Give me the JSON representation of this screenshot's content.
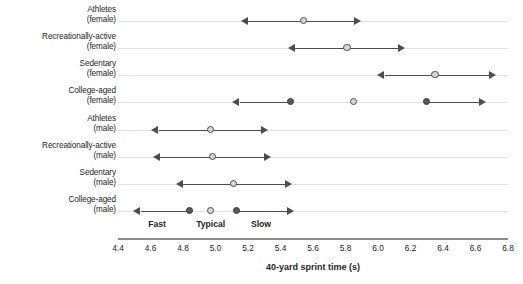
{
  "chart_data": {
    "type": "scatter",
    "title": "",
    "xlabel": "40-yard sprint time (s)",
    "ylabel": "",
    "xlim": [
      4.4,
      6.8
    ],
    "xticks": [
      "4.4",
      "4.6",
      "4.8",
      "5.0",
      "5.2",
      "5.4",
      "5.6",
      "5.8",
      "6.0",
      "6.2",
      "6.4",
      "6.6",
      "6.8"
    ],
    "xtick_values": [
      4.4,
      4.6,
      4.8,
      5.0,
      5.2,
      5.4,
      5.6,
      5.8,
      6.0,
      6.2,
      6.4,
      6.6,
      6.8
    ],
    "grid": false,
    "legend": "none",
    "orientation": "horizontal",
    "categories": [
      {
        "line1": "Athletes",
        "line2": "(female)"
      },
      {
        "line1": "Recreationally-active",
        "line2": "(female)"
      },
      {
        "line1": "Sedentary",
        "line2": "(female)"
      },
      {
        "line1": "College-aged",
        "line2": "(female)"
      },
      {
        "line1": "Athletes",
        "line2": "(male)"
      },
      {
        "line1": "Recreationally-active",
        "line2": "(male)"
      },
      {
        "line1": "Sedentary",
        "line2": "(male)"
      },
      {
        "line1": "College-aged",
        "line2": "(male)"
      }
    ],
    "rows": [
      {
        "category": "Athletes (female)",
        "markers": [
          {
            "value": 5.54,
            "style": "light",
            "arrow_left": true,
            "arrow_right": true,
            "range": [
              5.28,
              5.77
            ]
          }
        ]
      },
      {
        "category": "Recreationally-active (female)",
        "markers": [
          {
            "value": 5.81,
            "style": "light",
            "arrow_left": true,
            "arrow_right": true,
            "range": [
              5.57,
              6.04
            ]
          }
        ]
      },
      {
        "category": "Sedentary (female)",
        "markers": [
          {
            "value": 6.35,
            "style": "light",
            "arrow_left": true,
            "arrow_right": true,
            "range": [
              6.12,
              6.6
            ]
          }
        ]
      },
      {
        "category": "College-aged (female)",
        "markers": [
          {
            "value": 5.46,
            "style": "dark",
            "arrow_left": true,
            "arrow_right": false,
            "range": [
              5.23,
              5.46
            ]
          },
          {
            "value": 5.85,
            "style": "light",
            "arrow_left": false,
            "arrow_right": false,
            "range": [
              5.85,
              5.85
            ]
          },
          {
            "value": 6.3,
            "style": "dark",
            "arrow_left": false,
            "arrow_right": true,
            "range": [
              6.3,
              6.54
            ]
          }
        ]
      },
      {
        "category": "Athletes (male)",
        "markers": [
          {
            "value": 4.97,
            "style": "light",
            "arrow_left": true,
            "arrow_right": true,
            "range": [
              4.73,
              5.2
            ]
          }
        ]
      },
      {
        "category": "Recreationally-active (male)",
        "markers": [
          {
            "value": 4.98,
            "style": "light",
            "arrow_left": true,
            "arrow_right": true,
            "range": [
              4.74,
              5.22
            ]
          }
        ]
      },
      {
        "category": "Sedentary (male)",
        "markers": [
          {
            "value": 5.11,
            "style": "light",
            "arrow_left": true,
            "arrow_right": true,
            "range": [
              4.88,
              5.35
            ]
          }
        ]
      },
      {
        "category": "College-aged (male)",
        "markers": [
          {
            "value": 4.84,
            "style": "dark",
            "arrow_left": true,
            "arrow_right": false,
            "range": [
              4.62,
              4.84
            ]
          },
          {
            "value": 4.97,
            "style": "light",
            "arrow_left": false,
            "arrow_right": false,
            "range": [
              4.97,
              4.97
            ]
          },
          {
            "value": 5.13,
            "style": "dark",
            "arrow_left": false,
            "arrow_right": true,
            "range": [
              5.13,
              5.36
            ]
          }
        ]
      }
    ],
    "zone_annotations": [
      {
        "label": "Fast",
        "value": 4.64
      },
      {
        "label": "Typical",
        "value": 4.97
      },
      {
        "label": "Slow",
        "value": 5.28
      }
    ],
    "colors": {
      "marker_light_fill": "#d6d6d6",
      "marker_dark_fill": "#59595b",
      "marker_stroke": "#4d4d4d",
      "arrow": "#4d4d4d",
      "row_rule": "#e2e2e2",
      "axis": "#8c8c8c",
      "text": "#231f20"
    }
  }
}
